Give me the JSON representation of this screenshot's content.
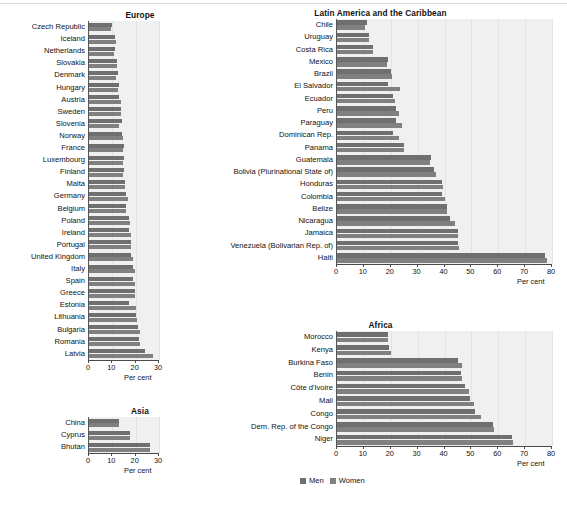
{
  "figure": {
    "legend": {
      "men_label": "Men",
      "women_label": "Women",
      "men_color": "#6f6f6f",
      "women_color": "#808080"
    },
    "axis_caption": "Per cent"
  },
  "chart_data": [
    {
      "type": "bar",
      "title": "Europe",
      "xlabel": "Per cent",
      "ylabel": "",
      "xlim": [
        0,
        30
      ],
      "xticks": [
        0,
        10,
        20,
        30
      ],
      "grid": true,
      "orientation": "horizontal",
      "legend_position": "figure-bottom",
      "categories": [
        "Czech Republic",
        "Iceland",
        "Netherlands",
        "Slovakia",
        "Denmark",
        "Hungary",
        "Austria",
        "Sweden",
        "Slovenia",
        "Norway",
        "France",
        "Luxembourg",
        "Finland",
        "Malta",
        "Germany",
        "Belgium",
        "Poland",
        "Ireland",
        "Portugal",
        "United Kingdom",
        "Italy",
        "Spain",
        "Greece",
        "Estonia",
        "Lithuania",
        "Bulgaria",
        "Romania",
        "Latvia"
      ],
      "series": [
        {
          "name": "Men",
          "values": [
            10.0,
            11.0,
            11.0,
            12.0,
            12.5,
            13.0,
            13.0,
            13.5,
            14.0,
            14.0,
            15.0,
            15.0,
            15.0,
            15.5,
            16.0,
            16.0,
            17.0,
            17.0,
            18.0,
            18.0,
            19.0,
            19.0,
            19.5,
            17.0,
            20.0,
            21.0,
            21.5,
            24.0
          ]
        },
        {
          "name": "Women",
          "values": [
            9.5,
            11.5,
            10.5,
            12.0,
            11.5,
            12.5,
            13.5,
            13.5,
            13.0,
            14.5,
            14.5,
            14.5,
            14.5,
            15.5,
            16.5,
            16.0,
            17.5,
            18.0,
            18.0,
            19.0,
            19.5,
            19.5,
            19.5,
            20.0,
            20.5,
            22.0,
            22.0,
            27.5
          ]
        }
      ]
    },
    {
      "type": "bar",
      "title": "Latin America and the Caribbean",
      "xlabel": "Per cent",
      "ylabel": "",
      "xlim": [
        0,
        80
      ],
      "xticks": [
        0,
        10,
        20,
        30,
        40,
        50,
        60,
        70,
        80
      ],
      "grid": true,
      "orientation": "horizontal",
      "legend_position": "figure-bottom",
      "categories": [
        "Chile",
        "Uruguay",
        "Costa Rica",
        "Mexico",
        "Brazil",
        "El Salvador",
        "Ecuador",
        "Peru",
        "Paraguay",
        "Dominican Rep.",
        "Panama",
        "Guatemala",
        "Bolivia (Plurinational State of)",
        "Honduras",
        "Colombia",
        "Belize",
        "Nicaragua",
        "Jamaica",
        "Venezuela (Bolivarian Rep. of)",
        "Haiti"
      ],
      "series": [
        {
          "name": "Men",
          "values": [
            11.0,
            12.0,
            13.5,
            19.0,
            20.0,
            19.0,
            21.0,
            22.0,
            22.0,
            21.0,
            25.0,
            35.0,
            36.0,
            39.0,
            39.0,
            41.0,
            42.0,
            45.0,
            45.0,
            77.5
          ]
        },
        {
          "name": "Women",
          "values": [
            10.5,
            12.0,
            13.5,
            18.5,
            20.5,
            23.5,
            21.5,
            23.0,
            24.0,
            23.0,
            25.0,
            34.5,
            37.0,
            39.5,
            40.0,
            41.0,
            44.0,
            45.0,
            45.5,
            78.0
          ]
        }
      ]
    },
    {
      "type": "bar",
      "title": "Asia",
      "xlabel": "Per cent",
      "ylabel": "",
      "xlim": [
        0,
        30
      ],
      "xticks": [
        0,
        10,
        20,
        30
      ],
      "grid": true,
      "orientation": "horizontal",
      "legend_position": "figure-bottom",
      "categories": [
        "China",
        "Cyprus",
        "Bhutan"
      ],
      "series": [
        {
          "name": "Men",
          "values": [
            13.0,
            17.5,
            26.0
          ]
        },
        {
          "name": "Women",
          "values": [
            13.0,
            17.5,
            26.0
          ]
        }
      ]
    },
    {
      "type": "bar",
      "title": "Africa",
      "xlabel": "Per cent",
      "ylabel": "",
      "xlim": [
        0,
        80
      ],
      "xticks": [
        0,
        10,
        20,
        30,
        40,
        50,
        60,
        70,
        80
      ],
      "grid": true,
      "orientation": "horizontal",
      "legend_position": "figure-bottom",
      "categories": [
        "Morocco",
        "Kenya",
        "Burkina Faso",
        "Benin",
        "Côte d'Ivoire",
        "Mali",
        "Congo",
        "Dem. Rep. of the Congo",
        "Niger"
      ],
      "series": [
        {
          "name": "Men",
          "values": [
            19.0,
            19.5,
            45.0,
            46.0,
            47.5,
            49.5,
            51.5,
            58.0,
            65.0
          ]
        },
        {
          "name": "Women",
          "values": [
            19.0,
            20.0,
            46.5,
            46.5,
            49.0,
            51.0,
            53.5,
            58.5,
            65.5
          ]
        }
      ]
    }
  ]
}
